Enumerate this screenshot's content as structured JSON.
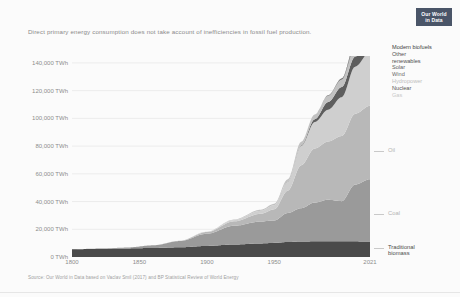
{
  "logo": {
    "line1": "Our World",
    "line2": "in Data"
  },
  "subtitle": "Direct primary energy consumption does not take account of inefficiencies in fossil fuel production.",
  "source": "Source: Our World in Data based on Vaclav Smil (2017) and BP Statistical Review of World Energy",
  "legend": [
    {
      "label": "Modern biofuels",
      "color": "#3d3d3d"
    },
    {
      "label": "Other",
      "color": "#4f4f4f"
    },
    {
      "label": "renewables",
      "color": "#4f4f4f"
    },
    {
      "label": "Solar",
      "color": "#5d5d5d"
    },
    {
      "label": "Wind",
      "color": "#6a6a6a"
    },
    {
      "label": "Hydropower",
      "color": "#bdbdbd"
    },
    {
      "label": "Nuclear",
      "color": "#555555"
    },
    {
      "label": "Gas",
      "color": "#c8c8c8"
    }
  ],
  "inline_labels": [
    {
      "label": "Oil",
      "color": "#b3b3b3"
    },
    {
      "label": "Coal",
      "color": "#b3b3b3"
    },
    {
      "label": "Traditional",
      "color": "#4a4a4a"
    },
    {
      "label": "biomass",
      "color": "#4a4a4a"
    }
  ],
  "chart_data": {
    "type": "area",
    "title": "",
    "subtitle": "Direct primary energy consumption does not take account of inefficiencies in fossil fuel production.",
    "xlabel": "",
    "ylabel": "",
    "xlim": [
      1800,
      2021
    ],
    "ylim": [
      0,
      145000
    ],
    "ytick_values": [
      0,
      20000,
      40000,
      60000,
      80000,
      100000,
      120000,
      140000
    ],
    "ytick_labels": [
      "0 TWh",
      "20,000 TWh",
      "40,000 TWh",
      "60,000 TWh",
      "80,000 TWh",
      "100,000 TWh",
      "120,000 TWh",
      "140,000 TWh"
    ],
    "xtick_values": [
      1800,
      1850,
      1900,
      1950,
      2021
    ],
    "xtick_labels": [
      "1800",
      "1850",
      "1900",
      "1950",
      "2021"
    ],
    "grid": true,
    "legend_position": "right",
    "stacked": true,
    "stack_order_bottom_to_top": [
      "Traditional biomass",
      "Coal",
      "Oil",
      "Gas",
      "Nuclear",
      "Hydropower",
      "Wind",
      "Solar",
      "Other renewables",
      "Modern biofuels"
    ],
    "x": [
      1800,
      1820,
      1840,
      1860,
      1880,
      1900,
      1920,
      1940,
      1950,
      1960,
      1970,
      1980,
      1990,
      2000,
      2010,
      2021
    ],
    "series": [
      {
        "name": "Traditional biomass",
        "color": "#4a4a4a",
        "values": [
          5556,
          5875,
          6194,
          6513,
          7000,
          8000,
          9000,
          9800,
          10200,
          10800,
          11200,
          11300,
          11300,
          11300,
          11300,
          11100
        ]
      },
      {
        "name": "Coal",
        "color": "#9a9a9a",
        "values": [
          97,
          190,
          580,
          1900,
          4500,
          8800,
          13500,
          15800,
          16200,
          21000,
          24000,
          28000,
          30000,
          29000,
          41000,
          45000
        ]
      },
      {
        "name": "Oil",
        "color": "#b8b8b8",
        "values": [
          0,
          0,
          0,
          10,
          180,
          1200,
          3200,
          5600,
          8000,
          16000,
          31000,
          39000,
          42000,
          47000,
          51000,
          53000
        ]
      },
      {
        "name": "Gas",
        "color": "#cfcfcf",
        "values": [
          0,
          0,
          0,
          0,
          30,
          200,
          900,
          2100,
          3000,
          6500,
          14000,
          19000,
          23000,
          28000,
          34000,
          39000
        ]
      },
      {
        "name": "Nuclear",
        "color": "#5e5e5e",
        "values": [
          0,
          0,
          0,
          0,
          0,
          0,
          0,
          0,
          0,
          100,
          500,
          2000,
          5500,
          7300,
          7300,
          7000
        ]
      },
      {
        "name": "Hydropower",
        "color": "#c2c2c2",
        "values": [
          0,
          0,
          0,
          0,
          0,
          100,
          400,
          800,
          1000,
          1700,
          2500,
          3500,
          4600,
          5400,
          6600,
          7500
        ]
      },
      {
        "name": "Wind",
        "color": "#707070",
        "values": [
          0,
          0,
          0,
          0,
          0,
          0,
          0,
          0,
          0,
          0,
          0,
          0,
          10,
          90,
          900,
          4300
        ]
      },
      {
        "name": "Solar",
        "color": "#636363",
        "values": [
          0,
          0,
          0,
          0,
          0,
          0,
          0,
          0,
          0,
          0,
          0,
          0,
          1,
          5,
          200,
          3400
        ]
      },
      {
        "name": "Other renewables",
        "color": "#525252",
        "values": [
          0,
          0,
          0,
          0,
          0,
          0,
          0,
          0,
          0,
          0,
          0,
          30,
          150,
          400,
          900,
          1900
        ]
      },
      {
        "name": "Modern biofuels",
        "color": "#3a3a3a",
        "values": [
          0,
          0,
          0,
          0,
          0,
          0,
          0,
          0,
          0,
          0,
          0,
          10,
          60,
          200,
          700,
          1200
        ]
      }
    ],
    "totals_note": "Global direct primary energy consumption by source, 1800 to 2021"
  }
}
